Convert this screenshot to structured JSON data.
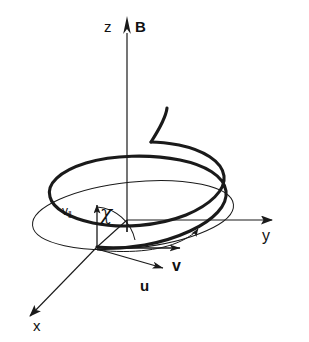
{
  "figure": {
    "background_color": "#ffffff",
    "line_color": "#1a1a1a",
    "helix_color": "#1a1a1a"
  },
  "axes": {
    "z": {
      "label": "z",
      "direction": "up"
    },
    "y": {
      "label": "y",
      "direction": "right"
    },
    "x": {
      "label": "x",
      "direction": "down-left"
    }
  },
  "vectors": {
    "magnetic_field": {
      "label": "B",
      "direction": "up",
      "along": "z"
    },
    "velocity": {
      "label": "v",
      "direction": "right"
    },
    "drift": {
      "label": "u",
      "direction": "down-right"
    },
    "parallel_velocity": {
      "label": "v",
      "subscript": "‖",
      "direction": "up"
    }
  },
  "angles": {
    "pitch": {
      "label": "χ",
      "between": "v-parallel and u"
    }
  },
  "curves": {
    "helix": {
      "name": "particle-helix",
      "turns": 1.6,
      "stroke_width": 3
    },
    "base_circle": {
      "name": "gyration-circle",
      "stroke_width": 1
    },
    "orbit_arc": {
      "name": "rotation-indicator-arc",
      "stroke_width": 1
    }
  }
}
